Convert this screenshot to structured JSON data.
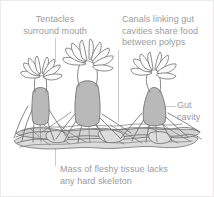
{
  "diagram": {
    "background_color": "#ffffff",
    "border_color": "#eceaea",
    "label_color": "#9b9b9b",
    "outline_color": "#6f6f6f",
    "tissue_fill_color": "#b9b9b9",
    "canal_fill_color": "#d8d8d8",
    "leader_line_color": "#bdbdbd"
  },
  "labels": {
    "tentacles": "Tentacles\nsurround mouth",
    "canals": "Canals linking gut\ncavities share food\nbetween polyps",
    "gut_cavity": "Gut\ncavity",
    "mass": "Mass of fleshy tissue lacks\nany hard skeleton"
  },
  "parts": {
    "polyp_left": "polyp-left",
    "polyp_center": "polyp-center",
    "polyp_right": "polyp-right",
    "tentacle_crown": "tentacle-crown",
    "mouth": "mouth",
    "gut_cavity_chamber": "gut-cavity-chamber",
    "canal_network": "canal-network",
    "tissue_mass": "tissue-mass"
  }
}
